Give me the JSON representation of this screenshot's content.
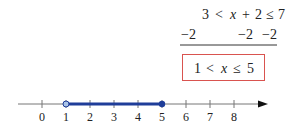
{
  "solution": {
    "row1": [
      "3",
      "<",
      "x",
      "+",
      "2",
      "≤",
      "7"
    ],
    "row2": [
      "−2",
      "−2",
      "−2"
    ],
    "result": [
      "1",
      "<",
      "x",
      "≤",
      "5"
    ],
    "colors": {
      "box_border": "#d9534f",
      "text": "#222222"
    }
  },
  "number_line": {
    "ticks": [
      "0",
      "1",
      "2",
      "3",
      "4",
      "5",
      "6",
      "7",
      "8"
    ],
    "interval": {
      "start": 1,
      "end": 5,
      "start_open": true,
      "end_closed": true
    },
    "colors": {
      "axis": "#777777",
      "interval": "#1f3d99",
      "open_fill": "#aac4e8"
    }
  }
}
